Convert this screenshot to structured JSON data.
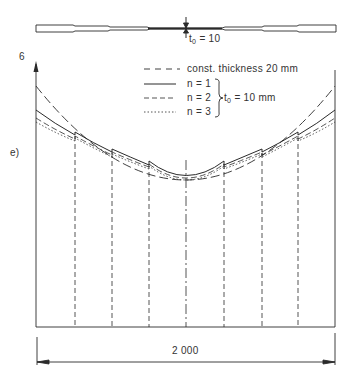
{
  "plate": {
    "label_t": "t",
    "label_sub": "0",
    "label_eq": " = 10"
  },
  "axis": {
    "y_label": "6",
    "panel_label": "e)"
  },
  "legend": {
    "items": [
      {
        "style": "dash-dot",
        "label": "const. thickness 20 mm"
      },
      {
        "style": "solid",
        "label": "n = 1"
      },
      {
        "style": "dashed",
        "label": "n = 2"
      },
      {
        "style": "dotted",
        "label": "n = 3"
      }
    ],
    "group_t": "t",
    "group_sub": "0",
    "group_eq": " = 10 mm"
  },
  "dimension": {
    "label": "2 000"
  },
  "colors": {
    "ink": "#2a2a2a",
    "background": "#ffffff"
  }
}
